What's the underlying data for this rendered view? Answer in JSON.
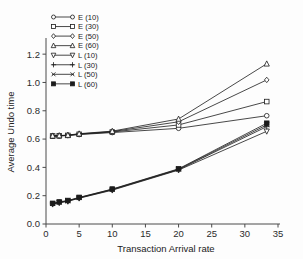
{
  "chart_data": {
    "type": "line",
    "title": "",
    "xlabel": "Transaction Arrival rate",
    "ylabel": "Average Undo time",
    "xlim": [
      0,
      35
    ],
    "ylim": [
      0.0,
      1.3
    ],
    "xticks": [
      0,
      5,
      10,
      15,
      20,
      25,
      30,
      35
    ],
    "xtick_labels": [
      "0",
      "5",
      "10",
      "15",
      "20",
      "25",
      "30",
      "35"
    ],
    "yticks": [
      0.0,
      0.2,
      0.4,
      0.6,
      0.8,
      1.0,
      1.2
    ],
    "ytick_labels": [
      "0.0",
      "0.2",
      "0.4",
      "0.6",
      "0.8",
      "1.0",
      "1.2"
    ],
    "grid": false,
    "legend_position": "top-left",
    "x": [
      1,
      2,
      3.3,
      5,
      10,
      20,
      33.3
    ],
    "series": [
      {
        "name": "E (10)",
        "marker": "circle-open",
        "values": [
          0.621,
          0.622,
          0.625,
          0.632,
          0.646,
          0.676,
          0.765
        ]
      },
      {
        "name": "E (30)",
        "marker": "square-open",
        "values": [
          0.622,
          0.623,
          0.626,
          0.634,
          0.65,
          0.7,
          0.865
        ]
      },
      {
        "name": "E (50)",
        "marker": "diamond-open",
        "values": [
          0.622,
          0.624,
          0.627,
          0.636,
          0.653,
          0.722,
          1.018
        ]
      },
      {
        "name": "E (60)",
        "marker": "triangle-up-open",
        "values": [
          0.623,
          0.625,
          0.628,
          0.638,
          0.656,
          0.742,
          1.132
        ]
      },
      {
        "name": "L (10)",
        "marker": "triangle-down-open",
        "values": [
          0.14,
          0.15,
          0.16,
          0.182,
          0.239,
          0.381,
          0.655
        ]
      },
      {
        "name": "L (30)",
        "marker": "plus",
        "values": [
          0.142,
          0.152,
          0.162,
          0.184,
          0.242,
          0.384,
          0.688
        ]
      },
      {
        "name": "L (50)",
        "marker": "cross",
        "values": [
          0.144,
          0.154,
          0.164,
          0.186,
          0.245,
          0.387,
          0.7
        ]
      },
      {
        "name": "L (60)",
        "marker": "square-filled",
        "values": [
          0.146,
          0.156,
          0.166,
          0.188,
          0.247,
          0.39,
          0.712
        ]
      }
    ]
  },
  "legend": {
    "entries": [
      {
        "label": "E (10)"
      },
      {
        "label": "E (30)"
      },
      {
        "label": "E (50)"
      },
      {
        "label": "E (60)"
      },
      {
        "label": "L (10)"
      },
      {
        "label": "L (30)"
      },
      {
        "label": "L (50)"
      },
      {
        "label": "L (60)"
      }
    ]
  },
  "colors": {
    "line": "#1b1b1b",
    "axis": "#4a4a4a",
    "text": "#222222",
    "background": "#fdfdfd"
  }
}
